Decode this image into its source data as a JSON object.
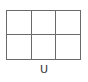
{
  "layout_option": {
    "label": "U",
    "icon": "grid-2x3-layout-icon",
    "rows": 2,
    "columns": 3,
    "line_color": "#6a6a6a"
  }
}
